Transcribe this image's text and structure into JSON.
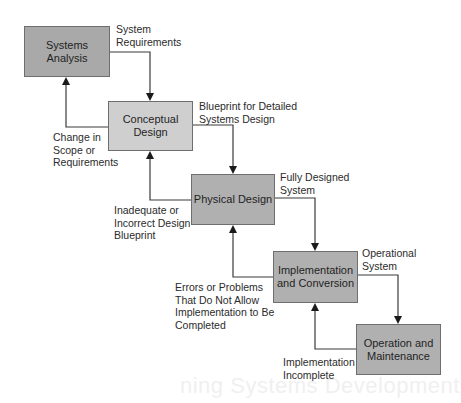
{
  "diagram": {
    "type": "waterfall-flowchart",
    "stages": [
      {
        "id": "systems-analysis",
        "label": "Systems Analysis",
        "fill": "#a9a9a9",
        "x": 24,
        "y": 26,
        "w": 86,
        "h": 51
      },
      {
        "id": "conceptual-design",
        "label": "Conceptual\nDesign",
        "fill": "#cfcfcf",
        "x": 108,
        "y": 101,
        "w": 85,
        "h": 50
      },
      {
        "id": "physical-design",
        "label": "Physical Design",
        "fill": "#b0b0b0",
        "x": 191,
        "y": 174,
        "w": 84,
        "h": 51
      },
      {
        "id": "implementation-conversion",
        "label": "Implementation\nand Conversion",
        "fill": "#b0b0b0",
        "x": 273,
        "y": 251,
        "w": 85,
        "h": 52
      },
      {
        "id": "operation-maintenance",
        "label": "Operation and\nMaintenance",
        "fill": "#b0b0b0",
        "x": 356,
        "y": 324,
        "w": 85,
        "h": 51
      }
    ],
    "forward_labels": [
      {
        "text": "System\nRequirements",
        "x": 116,
        "y": 23
      },
      {
        "text": "Blueprint for Detailed\nSystems Design",
        "x": 199,
        "y": 100
      },
      {
        "text": "Fully Designed\nSystem",
        "x": 280,
        "y": 171
      },
      {
        "text": "Operational\nSystem",
        "x": 362,
        "y": 247
      }
    ],
    "feedback_labels": [
      {
        "text": "Change in\nScope or\nRequirements",
        "x": 53,
        "y": 131
      },
      {
        "text": "Inadequate or\nIncorrect Design\nBlueprint",
        "x": 114,
        "y": 204
      },
      {
        "text": "Errors or Problems\nThat Do Not Allow\nImplementation to Be\nCompleted",
        "x": 175,
        "y": 281
      },
      {
        "text": "Implementation\nIncomplete",
        "x": 283,
        "y": 356
      }
    ],
    "background_bleed_text": "ning Systems Development",
    "colors": {
      "line": "#3a3a3a",
      "border": "#6e6e6e",
      "text": "#2b2b2b"
    }
  }
}
